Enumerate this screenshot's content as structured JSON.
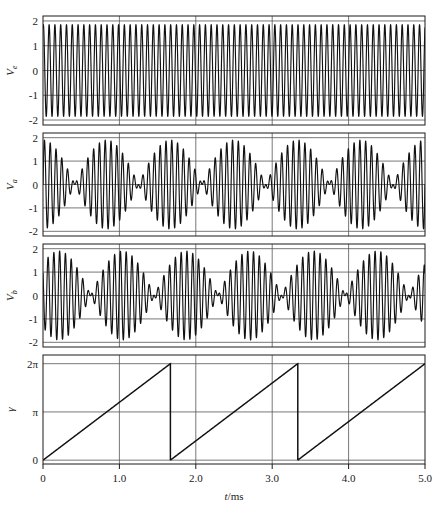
{
  "figure": {
    "background": "#ffffff",
    "line_color": "#111111",
    "grid_color": "#555555",
    "frame_color": "#1a1a1a"
  },
  "xaxis": {
    "label": "t/ms",
    "label_plain": "t/ms",
    "ticks": [
      0,
      1.0,
      2.0,
      3.0,
      4.0,
      5.0
    ],
    "tick_labels": [
      "0",
      "1.0",
      "2.0",
      "3.0",
      "4.0",
      "5.0"
    ],
    "min": 0,
    "max": 5.0,
    "units": "ms"
  },
  "chart_data": [
    {
      "type": "line",
      "id": "panel-ve",
      "title": "",
      "ylabel": "V",
      "ylabel_sub": "e",
      "xlabel": "",
      "xlim": [
        0,
        5.0
      ],
      "ylim": [
        -2.2,
        2.2
      ],
      "ytick_values": [
        2,
        1,
        0,
        -1,
        -2
      ],
      "ytick_labels": [
        "2",
        "1",
        "0",
        "-1",
        "-2"
      ],
      "xtick_values": [
        0,
        1.0,
        2.0,
        3.0,
        4.0,
        5.0
      ],
      "grid": true,
      "legend": "none",
      "description": "High frequency carrier sinusoid, constant amplitude",
      "waveform": "sine",
      "amplitude": 1.85,
      "frequency_khz": 13.2,
      "phase_rad": 1.2,
      "offset": 0
    },
    {
      "type": "line",
      "id": "panel-va",
      "title": "",
      "ylabel": "V",
      "ylabel_sub": "a",
      "xlabel": "",
      "xlim": [
        0,
        5.0
      ],
      "ylim": [
        -2.2,
        2.2
      ],
      "ytick_values": [
        2,
        1,
        0,
        -1,
        -2
      ],
      "ytick_labels": [
        "2",
        "1",
        "0",
        "-1",
        "-2"
      ],
      "xtick_values": [
        0,
        1.0,
        2.0,
        3.0,
        4.0,
        5.0
      ],
      "grid": true,
      "legend": "none",
      "description": "Amplitude-modulated beat waveform, sum of two close sinusoids",
      "waveform": "beat",
      "amplitude": 0.95,
      "carrier_khz": 13.2,
      "beat_period_ms": 0.833,
      "phase_rad": 0.0,
      "offset": 0
    },
    {
      "type": "line",
      "id": "panel-vb",
      "title": "",
      "ylabel": "V",
      "ylabel_sub": "b",
      "xlabel": "",
      "xlim": [
        0,
        5.0
      ],
      "ylim": [
        -2.2,
        2.2
      ],
      "ytick_values": [
        2,
        1,
        0,
        -1,
        -2
      ],
      "ytick_labels": [
        "2",
        "1",
        "0",
        "-1",
        "-2"
      ],
      "xtick_values": [
        0,
        1.0,
        2.0,
        3.0,
        4.0,
        5.0
      ],
      "grid": true,
      "legend": "none",
      "description": "Amplitude-modulated beat waveform, phase shifted relative to Va",
      "waveform": "beat",
      "amplitude": 0.95,
      "carrier_khz": 13.2,
      "beat_period_ms": 0.833,
      "phase_rad": 3.1416,
      "offset": 0
    },
    {
      "type": "line",
      "id": "panel-gamma",
      "title": "",
      "ylabel": "γ",
      "ylabel_sub": "",
      "xlabel": "",
      "xlim": [
        0,
        5.0
      ],
      "ylim": [
        -0.25,
        6.85
      ],
      "ytick_values": [
        6.2832,
        3.1416,
        0
      ],
      "ytick_labels": [
        "2π",
        "π",
        "0"
      ],
      "xtick_values": [
        0,
        1.0,
        2.0,
        3.0,
        4.0,
        5.0
      ],
      "grid": true,
      "legend": "none",
      "description": "Sawtooth phase ramp from 0 to 2 pi, resetting each period",
      "waveform": "sawtooth",
      "amplitude": 6.2832,
      "period_ms": 1.6667,
      "reset_times_ms": [
        1.6667,
        3.3333
      ],
      "offset": 0
    }
  ]
}
